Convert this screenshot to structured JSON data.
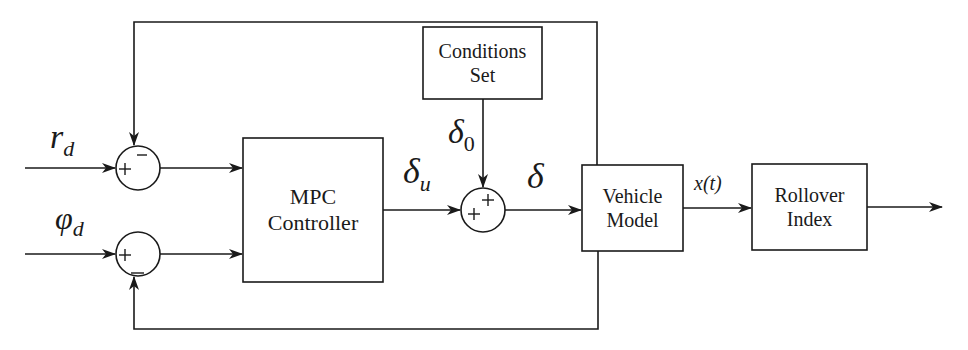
{
  "diagram": {
    "type": "block-diagram",
    "inputs": {
      "yaw_rate_ref": {
        "symbol": "r",
        "subscript": "d"
      },
      "roll_angle_ref": {
        "symbol": "φ",
        "subscript": "d"
      }
    },
    "summing_junctions": [
      {
        "id": "sum1",
        "signs": {
          "left": "+",
          "top": "−"
        }
      },
      {
        "id": "sum2",
        "signs": {
          "left": "+",
          "bottom": "−"
        }
      },
      {
        "id": "sum3",
        "signs": {
          "left": "+",
          "top": "+"
        }
      }
    ],
    "blocks": {
      "mpc": {
        "line1": "MPC",
        "line2": "Controller"
      },
      "conditions": {
        "line1": "Conditions",
        "line2": "Set"
      },
      "vehicle": {
        "line1": "Vehicle",
        "line2": "Model"
      },
      "rollover": {
        "line1": "Rollover",
        "line2": "Index"
      }
    },
    "signals": {
      "delta_u": {
        "symbol": "δ",
        "subscript": "u"
      },
      "delta_0": {
        "symbol": "δ",
        "subscript": "0"
      },
      "delta": {
        "symbol": "δ"
      },
      "state": {
        "label": "x(t)"
      }
    }
  }
}
